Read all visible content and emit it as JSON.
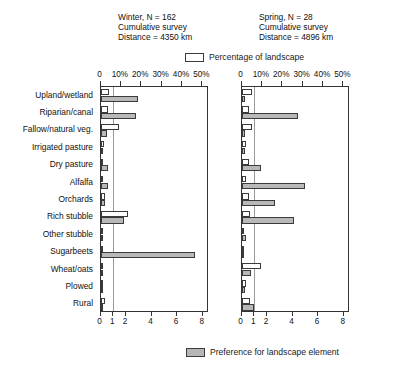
{
  "panels": [
    {
      "id": "winter",
      "title_line1": "Winter, N = 162",
      "title_line2": "Cumulative survey",
      "title_line3": "Distance = 4350 km"
    },
    {
      "id": "spring",
      "title_line1": "Spring, N = 28",
      "title_line2": "Cumulative survey",
      "title_line3": "Distance = 4896 km"
    }
  ],
  "legend": {
    "top_label": "Percentage of landscape",
    "bottom_label": "Preference for landscape element",
    "top_swatch": "open-rectangle-swatch",
    "bottom_swatch": "shaded-rectangle-swatch"
  },
  "axes": {
    "top_ticks": [
      "0",
      "10%",
      "20%",
      "30%",
      "40%",
      "50%"
    ],
    "top_values": [
      0,
      10,
      20,
      30,
      40,
      50
    ],
    "top_range": [
      0,
      52
    ],
    "bottom_ticks": [
      "0",
      "1",
      "2",
      "4",
      "6",
      "8"
    ],
    "bottom_values": [
      0,
      1,
      2,
      4,
      6,
      8
    ],
    "bottom_range": [
      0,
      8.3
    ],
    "reference_value": 1
  },
  "chart_data": {
    "type": "bar",
    "orientation": "horizontal",
    "xlabel": "",
    "ylabel": "",
    "grid": false,
    "legend_position": "top-center and bottom-center",
    "categories": [
      "Upland/wetland",
      "Riparian/canal",
      "Fallow/natural veg.",
      "Irrigated pasture",
      "Dry pasture",
      "Alfalfa",
      "Orchards",
      "Rich stubble",
      "Other stubble",
      "Sugarbeets",
      "Wheat/oats",
      "Plowed",
      "Rural"
    ],
    "panels": [
      {
        "name": "Winter, N = 162",
        "series": [
          {
            "name": "Percentage of landscape",
            "axis": "top",
            "units": "%",
            "axis_range": [
              0,
              52
            ],
            "values": [
              4.0,
              3.8,
              9.0,
              1.8,
              1.2,
              0.9,
              2.0,
              13.5,
              0.4,
              1.0,
              0.5,
              1.0,
              2.0
            ]
          },
          {
            "name": "Preference for landscape element",
            "axis": "bottom",
            "units": "index",
            "axis_range": [
              0,
              8.3
            ],
            "values": [
              2.9,
              2.8,
              0.5,
              0.15,
              0.55,
              0.55,
              0.35,
              1.85,
              0.12,
              7.4,
              0.0,
              0.05,
              0.1
            ]
          }
        ]
      },
      {
        "name": "Spring, N = 28",
        "series": [
          {
            "name": "Percentage of landscape",
            "axis": "top",
            "units": "%",
            "axis_range": [
              0,
              52
            ],
            "values": [
              5.0,
              3.8,
              5.0,
              2.0,
              3.5,
              2.0,
              3.8,
              4.0,
              1.0,
              0.3,
              9.5,
              2.0,
              4.0
            ]
          },
          {
            "name": "Preference for landscape element",
            "axis": "bottom",
            "units": "index",
            "axis_range": [
              0,
              8.3
            ],
            "values": [
              0.25,
              4.4,
              0.3,
              0.25,
              1.55,
              4.95,
              2.6,
              4.1,
              0.35,
              0.1,
              0.75,
              0.3,
              0.95
            ]
          }
        ]
      }
    ]
  }
}
